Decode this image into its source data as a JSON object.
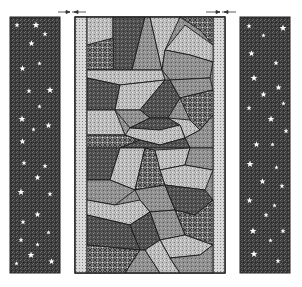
{
  "figure": {
    "caption_fragment": "",
    "panels": [
      {
        "name": "left-side-panel",
        "pattern": "starry-speckle",
        "bg": "#3a3a3a"
      },
      {
        "name": "center-panel",
        "pattern": "patchwork-mosaic",
        "bg": "#8a8a8a"
      },
      {
        "name": "right-side-panel",
        "pattern": "starry-speckle",
        "bg": "#3a3a3a"
      }
    ],
    "colors": {
      "dark": "#3a3a3a",
      "mid": "#8a8a8a",
      "light": "#c8c8c8",
      "line": "#1a1a1a",
      "star": "#ffffff"
    }
  }
}
